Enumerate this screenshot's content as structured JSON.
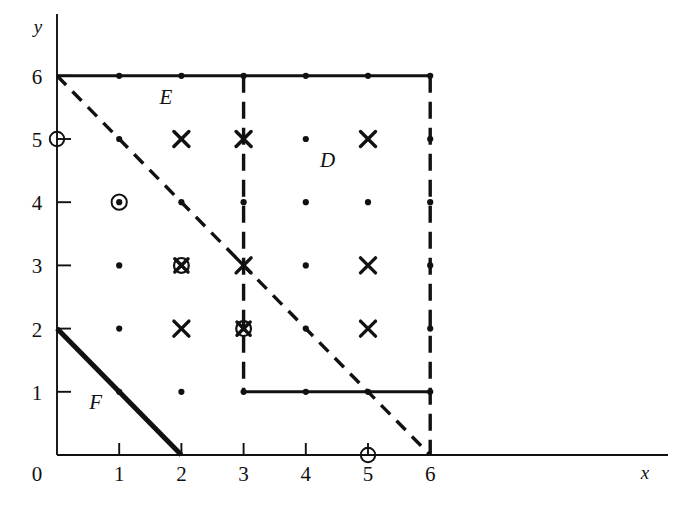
{
  "figure": {
    "kind": "cartesian-lattice-diagram",
    "axes": {
      "x_axis_label": "x",
      "y_axis_label": "y",
      "origin_label": "0",
      "x_ticks": [
        "1",
        "2",
        "3",
        "4",
        "5",
        "6"
      ],
      "y_ticks": [
        "1",
        "2",
        "3",
        "4",
        "5",
        "6"
      ],
      "x_tick_values": [
        1,
        2,
        3,
        4,
        5,
        6
      ],
      "y_tick_values": [
        1,
        2,
        3,
        4,
        5,
        6
      ],
      "x_range": [
        0,
        7
      ],
      "y_range": [
        0,
        6.6
      ]
    },
    "region_labels": [
      {
        "text": "E",
        "x": 1.75,
        "y": 5.55
      },
      {
        "text": "D",
        "x": 4.35,
        "y": 4.55
      },
      {
        "text": "F",
        "x": 0.62,
        "y": 0.72
      }
    ],
    "boundaries": [
      {
        "name": "region-E-dashed-hypotenuse",
        "style": "dashed",
        "from": {
          "x": 0,
          "y": 6
        },
        "to": {
          "x": 6,
          "y": 0
        }
      },
      {
        "name": "region-E-top-edge",
        "style": "solid-thick",
        "from": {
          "x": 0,
          "y": 6
        },
        "to": {
          "x": 6,
          "y": 6
        }
      },
      {
        "name": "region-D-left-edge",
        "style": "dashed-thick",
        "from": {
          "x": 3,
          "y": 6
        },
        "to": {
          "x": 3,
          "y": 1
        }
      },
      {
        "name": "region-D-bottom-edge",
        "style": "solid-thick",
        "from": {
          "x": 3,
          "y": 1
        },
        "to": {
          "x": 6,
          "y": 1
        }
      },
      {
        "name": "region-D-right-edge",
        "style": "dashed-thick",
        "from": {
          "x": 6,
          "y": 6
        },
        "to": {
          "x": 6,
          "y": 0
        }
      },
      {
        "name": "region-F-hypotenuse",
        "style": "solid-bold",
        "from": {
          "x": 0,
          "y": 2
        },
        "to": {
          "x": 2,
          "y": 0
        }
      }
    ],
    "markers": {
      "legend_semantics": {
        "dot": "lattice point",
        "cross": "point marked with X",
        "circle": "point marked with open circle",
        "circle-dot": "point marked with circle and dot",
        "circle-cross-dot": "point marked with circle, X and dot"
      },
      "points": [
        {
          "x": 0,
          "y": 5,
          "type": "circle"
        },
        {
          "x": 5,
          "y": 0,
          "type": "circle"
        },
        {
          "x": 1,
          "y": 4,
          "type": "circle-dot"
        },
        {
          "x": 2,
          "y": 3,
          "type": "circle-cross-dot"
        },
        {
          "x": 3,
          "y": 2,
          "type": "circle-cross-dot"
        },
        {
          "x": 2,
          "y": 5,
          "type": "cross"
        },
        {
          "x": 3,
          "y": 5,
          "type": "cross"
        },
        {
          "x": 5,
          "y": 5,
          "type": "cross"
        },
        {
          "x": 3,
          "y": 3,
          "type": "cross"
        },
        {
          "x": 5,
          "y": 3,
          "type": "cross"
        },
        {
          "x": 2,
          "y": 2,
          "type": "cross"
        },
        {
          "x": 5,
          "y": 2,
          "type": "cross"
        },
        {
          "x": 1,
          "y": 6,
          "type": "dot"
        },
        {
          "x": 2,
          "y": 6,
          "type": "dot"
        },
        {
          "x": 3,
          "y": 6,
          "type": "dot"
        },
        {
          "x": 4,
          "y": 6,
          "type": "dot"
        },
        {
          "x": 5,
          "y": 6,
          "type": "dot"
        },
        {
          "x": 6,
          "y": 6,
          "type": "dot"
        },
        {
          "x": 1,
          "y": 5,
          "type": "dot"
        },
        {
          "x": 4,
          "y": 5,
          "type": "dot"
        },
        {
          "x": 6,
          "y": 5,
          "type": "dot"
        },
        {
          "x": 2,
          "y": 4,
          "type": "dot"
        },
        {
          "x": 3,
          "y": 4,
          "type": "dot"
        },
        {
          "x": 4,
          "y": 4,
          "type": "dot"
        },
        {
          "x": 5,
          "y": 4,
          "type": "dot"
        },
        {
          "x": 6,
          "y": 4,
          "type": "dot"
        },
        {
          "x": 1,
          "y": 3,
          "type": "dot"
        },
        {
          "x": 4,
          "y": 3,
          "type": "dot"
        },
        {
          "x": 6,
          "y": 3,
          "type": "dot"
        },
        {
          "x": 1,
          "y": 2,
          "type": "dot"
        },
        {
          "x": 4,
          "y": 2,
          "type": "dot"
        },
        {
          "x": 6,
          "y": 2,
          "type": "dot"
        },
        {
          "x": 1,
          "y": 1,
          "type": "dot"
        },
        {
          "x": 2,
          "y": 1,
          "type": "dot"
        },
        {
          "x": 3,
          "y": 1,
          "type": "dot"
        },
        {
          "x": 4,
          "y": 1,
          "type": "dot"
        },
        {
          "x": 5,
          "y": 1,
          "type": "dot"
        },
        {
          "x": 6,
          "y": 1,
          "type": "dot"
        }
      ]
    },
    "colors": {
      "ink": "#111111",
      "background": "#ffffff"
    }
  }
}
